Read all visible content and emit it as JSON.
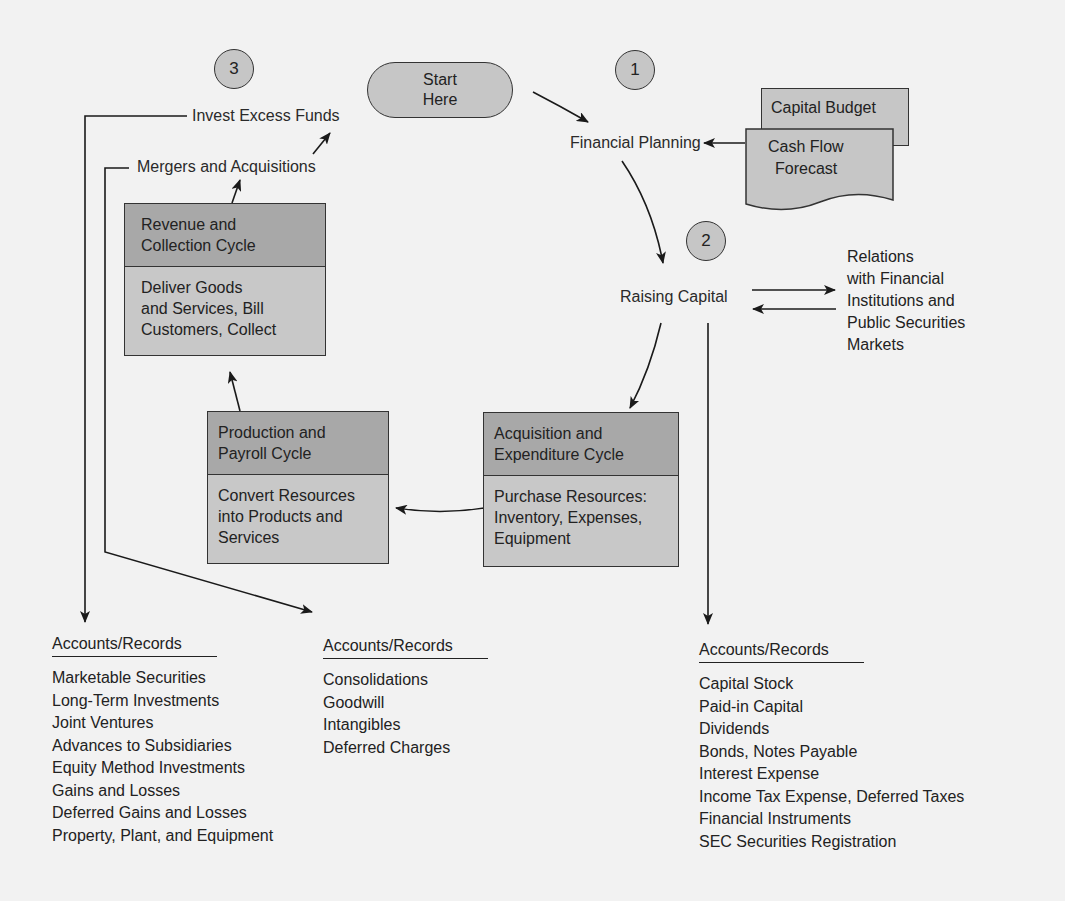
{
  "markers": [
    {
      "id": "1",
      "label": "1"
    },
    {
      "id": "2",
      "label": "2"
    },
    {
      "id": "3",
      "label": "3"
    }
  ],
  "start": {
    "line1": "Start",
    "line2": "Here"
  },
  "nodes": {
    "financial_planning": "Financial Planning",
    "raising_capital": "Raising Capital",
    "invest_excess_funds": "Invest Excess Funds",
    "mergers_acquisitions": "Mergers and Acquisitions",
    "relations": [
      "Relations",
      "with Financial",
      "Institutions and",
      "Public Securities",
      "Markets"
    ]
  },
  "documents": {
    "capital_budget": "Capital Budget",
    "cash_flow_forecast": [
      "Cash Flow",
      "Forecast"
    ]
  },
  "cycles": {
    "revenue": {
      "title": [
        "Revenue and",
        "Collection Cycle"
      ],
      "body": [
        "Deliver Goods",
        "and Services, Bill",
        "Customers, Collect"
      ]
    },
    "production": {
      "title": [
        "Production and",
        "Payroll Cycle"
      ],
      "body": [
        "Convert Resources",
        "into Products and",
        "Services"
      ]
    },
    "acquisition": {
      "title": [
        "Acquisition and",
        "Expenditure Cycle"
      ],
      "body": [
        "Purchase Resources:",
        "Inventory, Expenses,",
        "Equipment"
      ]
    }
  },
  "accounts": {
    "investments": {
      "title": "Accounts/Records",
      "items": [
        "Marketable Securities",
        "Long-Term Investments",
        "Joint Ventures",
        "Advances to Subsidiaries",
        "Equity Method Investments",
        "Gains and Losses",
        "Deferred Gains and Losses",
        "Property, Plant, and Equipment"
      ]
    },
    "mergers": {
      "title": "Accounts/Records",
      "items": [
        "Consolidations",
        "Goodwill",
        "Intangibles",
        "Deferred Charges"
      ]
    },
    "capital": {
      "title": "Accounts/Records",
      "items": [
        "Capital Stock",
        "Paid-in Capital",
        "Dividends",
        "Bonds, Notes Payable",
        "Interest Expense",
        "Income Tax Expense, Deferred Taxes",
        "Financial Instruments",
        "SEC Securities Registration"
      ]
    }
  },
  "colors": {
    "background": "#f2f2f2",
    "box_header": "#a8a8a8",
    "box_body": "#c8c8c8",
    "stroke": "#333333"
  }
}
